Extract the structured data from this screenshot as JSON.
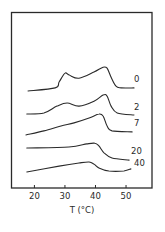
{
  "chart_data": {
    "type": "line",
    "title": "",
    "xlabel": "T (°C)",
    "ylabel": "",
    "xlim": [
      12.5,
      58.5
    ],
    "xticks": [
      20,
      30,
      40,
      50
    ],
    "xtick_labels": [
      "20",
      "30",
      "40",
      "50"
    ],
    "grid": false,
    "legend": "inline labels at right end of each curve",
    "y_units": "arbitrary (vertically offset traces)",
    "series": [
      {
        "name": "0",
        "points": [
          [
            17.9,
            0.0
          ],
          [
            26.8,
            0.9
          ],
          [
            28.1,
            2.6
          ],
          [
            30.0,
            5.2
          ],
          [
            31.4,
            4.6
          ],
          [
            34.6,
            3.7
          ],
          [
            39.5,
            5.5
          ],
          [
            42.5,
            6.9
          ],
          [
            43.8,
            6.6
          ],
          [
            45.1,
            4.0
          ],
          [
            46.7,
            1.4
          ],
          [
            48.4,
            0.9
          ],
          [
            52.6,
            0.9
          ]
        ]
      },
      {
        "name": "2",
        "points": [
          [
            17.5,
            0.0
          ],
          [
            23.1,
            0.3
          ],
          [
            27.4,
            2.3
          ],
          [
            30.7,
            3.2
          ],
          [
            34.6,
            2.3
          ],
          [
            39.5,
            3.7
          ],
          [
            42.5,
            5.5
          ],
          [
            43.8,
            5.2
          ],
          [
            45.1,
            2.3
          ],
          [
            47.1,
            0.3
          ],
          [
            52.6,
            -0.3
          ]
        ]
      },
      {
        "name": "7",
        "points": [
          [
            17.2,
            0.0
          ],
          [
            23.1,
            1.2
          ],
          [
            28.7,
            2.6
          ],
          [
            33.0,
            3.5
          ],
          [
            37.9,
            4.9
          ],
          [
            41.1,
            6.1
          ],
          [
            42.5,
            5.5
          ],
          [
            43.8,
            2.6
          ],
          [
            45.4,
            1.2
          ],
          [
            52.0,
            0.9
          ]
        ]
      },
      {
        "name": "20",
        "points": [
          [
            17.5,
            0.0
          ],
          [
            31.3,
            0.3
          ],
          [
            37.2,
            1.2
          ],
          [
            39.8,
            1.4
          ],
          [
            41.1,
            0.6
          ],
          [
            42.8,
            -1.4
          ],
          [
            45.4,
            -2.9
          ],
          [
            51.0,
            -3.5
          ]
        ]
      },
      {
        "name": "40",
        "points": [
          [
            17.5,
            0.0
          ],
          [
            28.1,
            1.7
          ],
          [
            34.6,
            2.6
          ],
          [
            37.9,
            2.9
          ],
          [
            39.5,
            2.3
          ],
          [
            41.1,
            1.2
          ],
          [
            44.4,
            0.3
          ],
          [
            49.3,
            0.3
          ],
          [
            51.6,
            0.9
          ]
        ]
      }
    ]
  }
}
